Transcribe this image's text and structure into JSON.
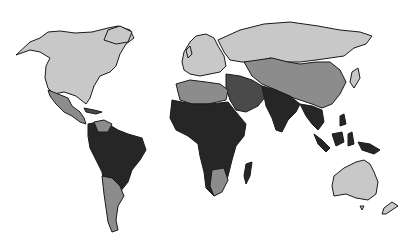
{
  "map": {
    "type": "choropleth-world",
    "legend": null,
    "shading_levels": [
      {
        "level": 1,
        "name": "light",
        "color": "#c8c8c8"
      },
      {
        "level": 2,
        "name": "medium",
        "color": "#8c8c8c"
      },
      {
        "level": 3,
        "name": "dark",
        "color": "#4a4a4a"
      },
      {
        "level": 4,
        "name": "darkest",
        "color": "#262626"
      }
    ],
    "regions": [
      {
        "id": "north-america",
        "shade": "light"
      },
      {
        "id": "greenland",
        "shade": "light"
      },
      {
        "id": "mexico-central-america",
        "shade": "medium"
      },
      {
        "id": "caribbean",
        "shade": "dark"
      },
      {
        "id": "south-america-north",
        "shade": "darkest"
      },
      {
        "id": "venezuela-colombia",
        "shade": "medium"
      },
      {
        "id": "southern-cone",
        "shade": "medium"
      },
      {
        "id": "europe",
        "shade": "light"
      },
      {
        "id": "russia",
        "shade": "light"
      },
      {
        "id": "central-asia-china",
        "shade": "medium"
      },
      {
        "id": "middle-east",
        "shade": "dark"
      },
      {
        "id": "north-africa",
        "shade": "medium"
      },
      {
        "id": "sub-saharan-africa",
        "shade": "darkest"
      },
      {
        "id": "southern-africa",
        "shade": "medium"
      },
      {
        "id": "madagascar",
        "shade": "darkest"
      },
      {
        "id": "south-asia",
        "shade": "darkest"
      },
      {
        "id": "southeast-asia",
        "shade": "darkest"
      },
      {
        "id": "japan",
        "shade": "light"
      },
      {
        "id": "australia",
        "shade": "light"
      },
      {
        "id": "new-zealand",
        "shade": "light"
      }
    ]
  }
}
